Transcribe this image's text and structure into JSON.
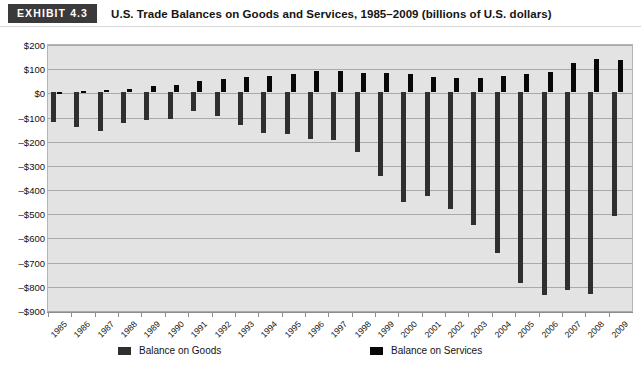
{
  "header": {
    "badge": "EXHIBIT 4.3",
    "title": "U.S. Trade Balances on Goods and Services, 1985–2009 (billions of U.S. dollars)"
  },
  "legend": {
    "goods_label": "Balance on Goods",
    "services_label": "Balance on Services",
    "goods_color": "#2f2f2f",
    "services_color": "#080808"
  },
  "axis": {
    "y_ticks": [
      "$200",
      "$100",
      "$0",
      "–$100",
      "–$200",
      "–$300",
      "–$400",
      "–$500",
      "–$600",
      "–$700",
      "–$800",
      "–$900"
    ],
    "y_tick_values": [
      200,
      100,
      0,
      -100,
      -200,
      -300,
      -400,
      -500,
      -600,
      -700,
      -800,
      -900
    ]
  },
  "chart_data": {
    "type": "bar",
    "title": "U.S. Trade Balances on Goods and Services, 1985–2009 (billions of U.S. dollars)",
    "xlabel": "",
    "ylabel": "",
    "ylim": [
      -900,
      200
    ],
    "grid": true,
    "legend_position": "bottom",
    "categories": [
      "1985",
      "1986",
      "1987",
      "1988",
      "1989",
      "1990",
      "1991",
      "1992",
      "1993",
      "1994",
      "1995",
      "1996",
      "1997",
      "1998",
      "1999",
      "2000",
      "2001",
      "2002",
      "2003",
      "2004",
      "2005",
      "2006",
      "2007",
      "2008",
      "2009"
    ],
    "series": [
      {
        "name": "Balance on Goods",
        "color": "#2f2f2f",
        "values": [
          -122,
          -145,
          -160,
          -127,
          -115,
          -111,
          -77,
          -97,
          -133,
          -166,
          -174,
          -191,
          -198,
          -247,
          -346,
          -452,
          -427,
          -482,
          -548,
          -665,
          -787,
          -838,
          -819,
          -835,
          -510
        ]
      },
      {
        "name": "Balance on Services",
        "color": "#080808",
        "values": [
          0,
          7,
          8,
          13,
          25,
          30,
          46,
          56,
          62,
          67,
          78,
          87,
          90,
          82,
          82,
          75,
          64,
          61,
          61,
          68,
          76,
          85,
          122,
          136,
          132
        ]
      }
    ]
  }
}
